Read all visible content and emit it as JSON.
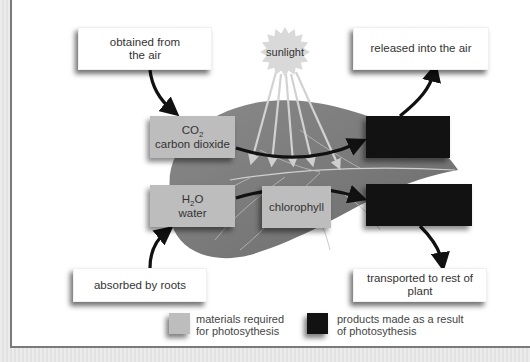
{
  "diagram": {
    "callouts": {
      "top_left": "obtained from the air",
      "top_left_line1": "obtained from",
      "top_left_line2": "the air",
      "top_right": "released into the air",
      "bottom_left": "absorbed by roots",
      "bottom_right": "transported to rest of plant"
    },
    "sun": {
      "label": "sunlight"
    },
    "materials": {
      "co2": {
        "formula_main": "CO",
        "formula_sub": "2",
        "name": "carbon dioxide"
      },
      "h2o": {
        "formula_pre": "H",
        "formula_sub": "2",
        "formula_post": "O",
        "name": "water"
      },
      "chlorophyll": {
        "name": "chlorophyll"
      }
    },
    "products": [
      {
        "id": "product-1",
        "label": ""
      },
      {
        "id": "product-2",
        "label": ""
      }
    ],
    "legend": {
      "materials_line1": "materials required",
      "materials_line2": "for photosythesis",
      "products_line1": "products made as a result",
      "products_line2": "of photosythesis"
    },
    "colors": {
      "material_box": "#bdbdbd",
      "product_box": "#121212",
      "leaf": "#7d7d7d",
      "sun": "#d9d9d9",
      "arrow": "#111111"
    }
  }
}
